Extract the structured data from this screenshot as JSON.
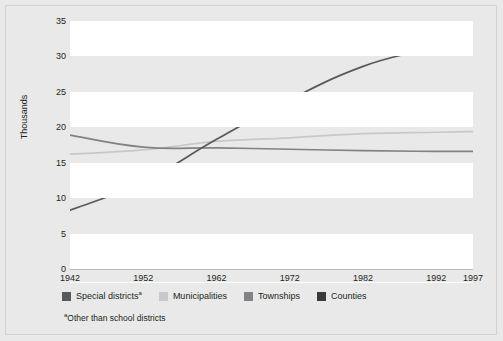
{
  "chart_data": {
    "type": "line",
    "title": "",
    "xlabel": "",
    "ylabel": "Thousands",
    "x": [
      1942,
      1952,
      1962,
      1972,
      1982,
      1992,
      1997
    ],
    "xticklabels": [
      "1942",
      "1952",
      "1962",
      "1972",
      "1982",
      "1992",
      "1997"
    ],
    "yticklabels": [
      "0",
      "5",
      "10",
      "15",
      "20",
      "25",
      "30",
      "35"
    ],
    "yticks": [
      0,
      5,
      10,
      15,
      20,
      25,
      30,
      35
    ],
    "ylim": [
      0,
      35
    ],
    "xlim": [
      1942,
      1997
    ],
    "grid": false,
    "banded_background": true,
    "legend_position": "bottom-left",
    "footnote": "Other than school districts",
    "footnote_marker": "a",
    "series": [
      {
        "name": "Special districts",
        "name_marker": "a",
        "color": "#58595b",
        "values": [
          8.3,
          12.3,
          18.3,
          23.9,
          28.6,
          31.6,
          34.7
        ]
      },
      {
        "name": "Municipalities",
        "color": "#c7c8ca",
        "values": [
          16.2,
          16.8,
          18.0,
          18.5,
          19.1,
          19.3,
          19.4
        ]
      },
      {
        "name": "Townships",
        "color": "#808285",
        "values": [
          18.9,
          17.2,
          17.1,
          16.9,
          16.7,
          16.6,
          16.6
        ]
      },
      {
        "name": "Counties",
        "color": "#3b3b3d",
        "values": [
          3.05,
          3.05,
          3.05,
          3.05,
          3.04,
          3.04,
          3.04
        ]
      }
    ]
  },
  "legend": {
    "items": [
      {
        "label": "Special districts",
        "marker": "a",
        "color": "#58595b"
      },
      {
        "label": "Municipalities",
        "marker": "",
        "color": "#c7c8ca"
      },
      {
        "label": "Townships",
        "marker": "",
        "color": "#808285"
      },
      {
        "label": "Counties",
        "marker": "",
        "color": "#3b3b3d"
      }
    ]
  },
  "axes": {
    "y_label": "Thousands",
    "y_ticks": [
      "35",
      "30",
      "25",
      "20",
      "15",
      "10",
      "5",
      "0"
    ],
    "x_ticks": [
      "1942",
      "1952",
      "1962",
      "1972",
      "1982",
      "1992",
      "1997"
    ]
  },
  "footnote": {
    "marker": "a",
    "text": "Other than school districts"
  }
}
